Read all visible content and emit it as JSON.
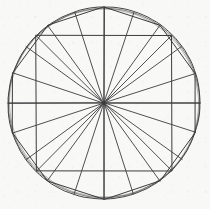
{
  "figure": {
    "type": "geometric-line-drawing",
    "medium": "hand-drawn ink on paper",
    "background_color": "#f8f8f6",
    "ink_color": "#3c3c3e"
  },
  "canvas": {
    "width": 210,
    "height": 209
  },
  "geometry": {
    "center": {
      "x": 104,
      "y": 103
    },
    "radius": 96,
    "circle": {
      "name": "circumscribing-circle",
      "stroke_width": 1.0,
      "overdraw_passes": 3,
      "overdraw_radii": [
        96,
        95.1,
        94.2
      ],
      "note": "drawn with several overlapping freehand passes giving a doubled rim"
    },
    "square": {
      "name": "inscribed-square",
      "vertex_count": 4,
      "vertex_angles_deg": [
        45,
        135,
        225,
        315
      ],
      "stroke_width": 1.0,
      "vertices": [
        {
          "x": 171.9,
          "y": 35.1
        },
        {
          "x": 36.1,
          "y": 35.1
        },
        {
          "x": 36.1,
          "y": 170.9
        },
        {
          "x": 171.9,
          "y": 170.9
        }
      ]
    },
    "decagon": {
      "name": "inscribed-decagon",
      "vertex_count": 10,
      "start_angle_deg": 90,
      "step_deg": 36,
      "stroke_width": 1.0,
      "vertex_angles_deg": [
        90,
        126,
        162,
        198,
        234,
        270,
        306,
        342,
        18,
        54
      ],
      "vertices": [
        {
          "x": 104.0,
          "y": 7.0
        },
        {
          "x": 47.6,
          "y": 25.3
        },
        {
          "x": 12.7,
          "y": 73.3
        },
        {
          "x": 12.7,
          "y": 132.7
        },
        {
          "x": 47.6,
          "y": 180.7
        },
        {
          "x": 104.0,
          "y": 199.0
        },
        {
          "x": 160.4,
          "y": 180.7
        },
        {
          "x": 195.3,
          "y": 132.7
        },
        {
          "x": 195.3,
          "y": 73.3
        },
        {
          "x": 160.4,
          "y": 25.3
        }
      ]
    },
    "spokes": {
      "name": "radial-spokes",
      "count": 20,
      "stroke_width": 0.9,
      "description": "one radius drawn from the centre to each square corner and each decagon vertex, plus the horizontal and vertical diameters",
      "angles_deg": [
        0,
        18,
        36,
        45,
        54,
        72,
        90,
        108,
        126,
        135,
        144,
        162,
        180,
        198,
        216,
        225,
        234,
        252,
        270,
        288,
        306,
        315,
        324,
        342
      ]
    },
    "diameters": {
      "name": "axis-diameters",
      "horizontal": {
        "x1": 8,
        "y1": 103,
        "x2": 200,
        "y2": 103
      },
      "vertical": {
        "x1": 104,
        "y1": 7,
        "x2": 104,
        "y2": 199
      }
    }
  },
  "labels": {
    "caption": ""
  }
}
